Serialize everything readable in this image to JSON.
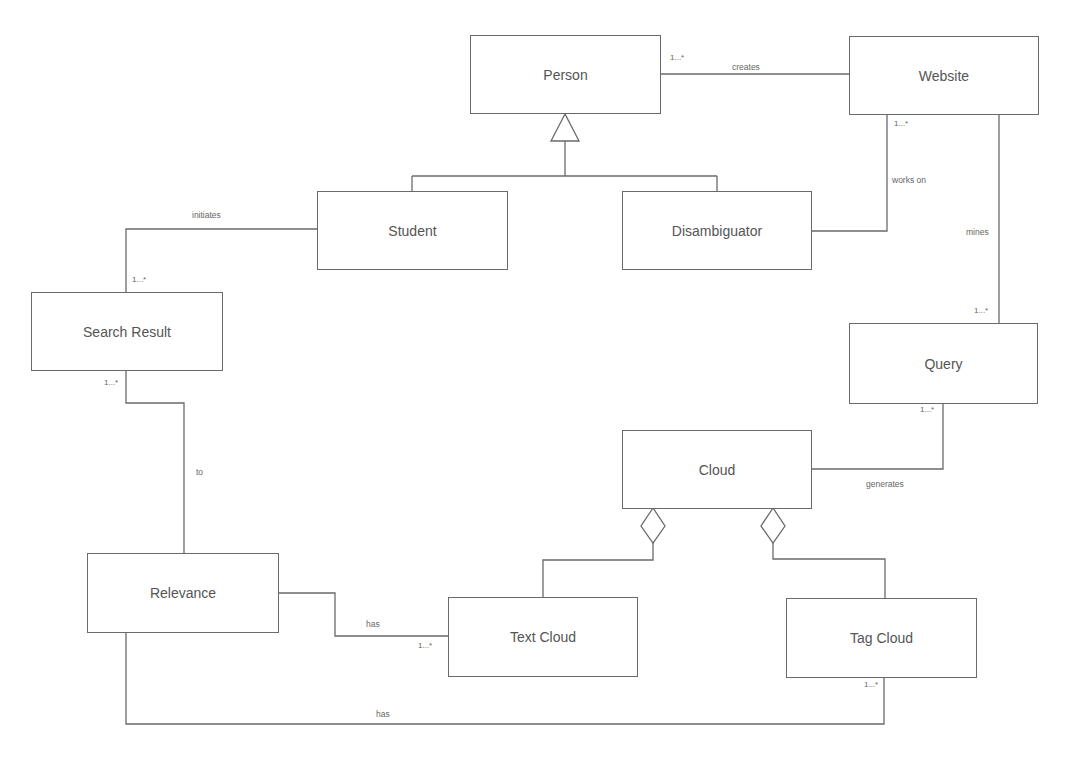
{
  "diagram": {
    "type": "UML class diagram",
    "classes": [
      {
        "id": "person",
        "name": "Person"
      },
      {
        "id": "website",
        "name": "Website"
      },
      {
        "id": "student",
        "name": "Student"
      },
      {
        "id": "disambiguator",
        "name": "Disambiguator"
      },
      {
        "id": "search_result",
        "name": "Search Result"
      },
      {
        "id": "query",
        "name": "Query"
      },
      {
        "id": "cloud",
        "name": "Cloud"
      },
      {
        "id": "relevance",
        "name": "Relevance"
      },
      {
        "id": "text_cloud",
        "name": "Text Cloud"
      },
      {
        "id": "tag_cloud",
        "name": "Tag Cloud"
      }
    ],
    "associations": [
      {
        "from": "Person",
        "to": "Website",
        "label": "creates",
        "multiplicity": "1...*"
      },
      {
        "from": "Disambiguator",
        "to": "Website",
        "label": "works on",
        "multiplicity": "1...*"
      },
      {
        "from": "Website",
        "to": "Query",
        "label": "mines",
        "multiplicity": "1...*"
      },
      {
        "from": "Student",
        "to": "Search Result",
        "label": "initiates",
        "multiplicity": "1...*"
      },
      {
        "from": "Search Result",
        "to": "Relevance",
        "label": "to",
        "multiplicity": "1...*"
      },
      {
        "from": "Query",
        "to": "Cloud",
        "label": "generates",
        "multiplicity": "1...*"
      },
      {
        "from": "Relevance",
        "to": "Text Cloud",
        "label": "has",
        "multiplicity": "1...*"
      },
      {
        "from": "Relevance",
        "to": "Tag Cloud",
        "label": "has",
        "multiplicity": "1...*"
      }
    ],
    "generalizations": [
      {
        "parent": "Person",
        "children": [
          "Student",
          "Disambiguator"
        ]
      }
    ],
    "aggregations": [
      {
        "whole": "Cloud",
        "part": "Text Cloud"
      },
      {
        "whole": "Cloud",
        "part": "Tag Cloud"
      }
    ]
  },
  "labels": {
    "creates": "creates",
    "works_on": "works on",
    "mines": "mines",
    "initiates": "initiates",
    "to": "to",
    "generates": "generates",
    "has_text": "has",
    "has_tag": "has"
  },
  "multiplicities": {
    "person_website": "1...*",
    "website_disamb": "1...*",
    "query_top": "1...*",
    "search_result_top": "1...*",
    "search_result_bottom": "1...*",
    "query_bottom": "1...*",
    "text_cloud": "1...*",
    "tag_cloud": "1...*"
  },
  "colors": {
    "line": "#6a6a6a",
    "text": "#555555",
    "background": "#ffffff"
  }
}
